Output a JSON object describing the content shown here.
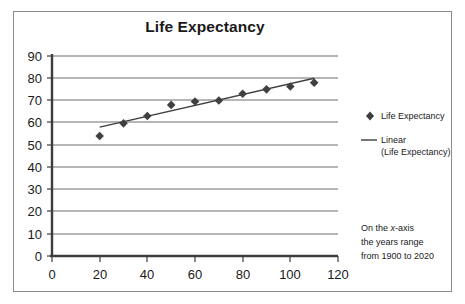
{
  "chart_data": {
    "type": "scatter",
    "title": "Life Expectancy",
    "xlabel": "",
    "ylabel": "",
    "xlim": [
      0,
      120
    ],
    "ylim": [
      0,
      90
    ],
    "xticks": [
      "0",
      "20",
      "40",
      "60",
      "80",
      "100",
      "120"
    ],
    "yticks": [
      "0",
      "10",
      "20",
      "30",
      "40",
      "50",
      "60",
      "70",
      "80",
      "90"
    ],
    "grid": "horizontal",
    "legend_position": "right",
    "x": [
      20,
      30,
      40,
      50,
      60,
      70,
      80,
      90,
      100,
      110
    ],
    "series": [
      {
        "name": "Life Expectancy",
        "kind": "scatter",
        "marker": "diamond",
        "color": "#404040",
        "values": [
          54,
          59.7,
          63,
          68,
          69.5,
          70,
          73,
          75,
          76.3,
          78
        ]
      },
      {
        "name": "Linear (Life Expectancy)",
        "kind": "line",
        "color": "#404040",
        "x_endpoints": [
          20,
          110
        ],
        "y_endpoints": [
          58,
          80
        ]
      }
    ],
    "annotations": [
      {
        "id": "x-axis-note",
        "line1_pre": "On the ",
        "line1_italic": "x",
        "line1_post": "-axis",
        "line2": "the years range",
        "line3": "from 1900 to 2020"
      }
    ]
  },
  "legend": {
    "entries": [
      {
        "label": "Life Expectancy",
        "marker": "diamond"
      },
      {
        "label_line1": "Linear",
        "label_line2": "(Life Expectancy)",
        "marker": "line"
      }
    ]
  },
  "colors": {
    "frame": "#8c8c8c",
    "axis": "#3d3d3d",
    "gridline": "#6e6e6e",
    "marker": "#3d3d3d",
    "trendline": "#4a4a4a",
    "text": "#1a1a1a",
    "background": "#ffffff"
  }
}
